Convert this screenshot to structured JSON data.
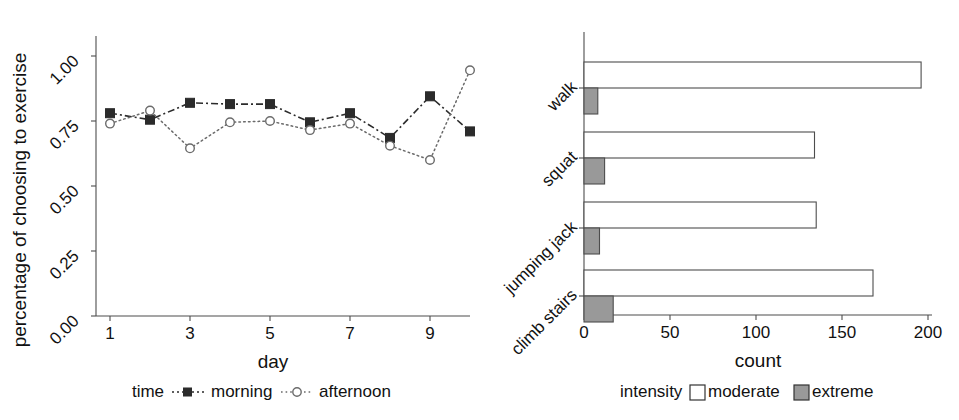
{
  "figure": {
    "background": "#ffffff",
    "width": 959,
    "height": 420
  },
  "colors": {
    "ink": "#1a1a1a",
    "axis": "#4d4d4d",
    "morning_series": "#2b2b2b",
    "afternoon_series": "#6b6b6b",
    "bar_moderate_fill": "#ffffff",
    "bar_extreme_fill": "#999999",
    "bar_outline": "#4d4d4d"
  },
  "chart_data": [
    {
      "id": "exercise-adherence-line",
      "type": "line",
      "title": "",
      "xlabel": "day",
      "ylabel": "percentage of choosing to exercise",
      "x": [
        1,
        2,
        3,
        4,
        5,
        6,
        7,
        8,
        9,
        10
      ],
      "xticks": [
        1,
        3,
        5,
        7,
        9
      ],
      "xtick_labels": [
        "1",
        "3",
        "5",
        "7",
        "9"
      ],
      "xlim": [
        0.6,
        10.4
      ],
      "yticks": [
        0.0,
        0.25,
        0.5,
        0.75,
        1.0
      ],
      "ytick_labels": [
        "0.00",
        "0.25",
        "0.50",
        "0.75",
        "1.00"
      ],
      "ylim": [
        0.0,
        1.04
      ],
      "grid": false,
      "legend_position": "bottom",
      "legend_title": "time",
      "series": [
        {
          "name": "morning",
          "marker": "filled-square",
          "linestyle": "dash-dot",
          "values": [
            0.78,
            0.755,
            0.82,
            0.815,
            0.815,
            0.745,
            0.78,
            0.685,
            0.845,
            0.71
          ]
        },
        {
          "name": "afternoon",
          "marker": "open-circle",
          "linestyle": "dotted",
          "values": [
            0.74,
            0.79,
            0.645,
            0.745,
            0.75,
            0.715,
            0.74,
            0.655,
            0.6,
            0.945
          ]
        }
      ]
    },
    {
      "id": "exercise-count-bar",
      "type": "bar",
      "orientation": "horizontal",
      "title": "",
      "xlabel": "count",
      "ylabel": "",
      "categories": [
        "walk",
        "squat",
        "jumping jack",
        "climb stairs"
      ],
      "xticks": [
        0,
        50,
        100,
        150,
        200
      ],
      "xtick_labels": [
        "0",
        "50",
        "100",
        "150",
        "200"
      ],
      "xlim": [
        0,
        207
      ],
      "grid": false,
      "legend_position": "bottom",
      "legend_title": "intensity",
      "series": [
        {
          "name": "moderate",
          "fill": "#ffffff",
          "values": [
            196,
            134,
            135,
            168
          ]
        },
        {
          "name": "extreme",
          "fill": "#999999",
          "values": [
            8,
            12,
            9,
            17
          ]
        }
      ]
    }
  ],
  "left_chart": {
    "y_axis_title": "percentage of choosing to exercise",
    "x_axis_title": "day",
    "y_ticks": [
      "0.00",
      "0.25",
      "0.50",
      "0.75",
      "1.00"
    ],
    "x_ticks": [
      "1",
      "3",
      "5",
      "7",
      "9"
    ],
    "legend": {
      "title": "time",
      "items": [
        {
          "label": "morning",
          "marker": "filled-square-marker"
        },
        {
          "label": "afternoon",
          "marker": "open-circle-marker"
        }
      ]
    }
  },
  "right_chart": {
    "x_axis_title": "count",
    "x_ticks": [
      "0",
      "50",
      "100",
      "150",
      "200"
    ],
    "y_ticks": [
      "walk",
      "squat",
      "jumping jack",
      "climb stairs"
    ],
    "legend": {
      "title": "intensity",
      "items": [
        {
          "label": "moderate",
          "swatch": "white-square-swatch"
        },
        {
          "label": "extreme",
          "swatch": "gray-square-swatch"
        }
      ]
    }
  }
}
